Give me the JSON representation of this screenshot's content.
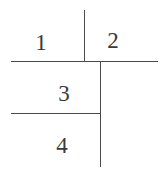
{
  "diagram": {
    "labels": [
      {
        "text": "1",
        "x": 41,
        "y": 42
      },
      {
        "text": "2",
        "x": 113,
        "y": 40
      },
      {
        "text": "3",
        "x": 64,
        "y": 93
      },
      {
        "text": "4",
        "x": 62,
        "y": 145
      }
    ]
  }
}
